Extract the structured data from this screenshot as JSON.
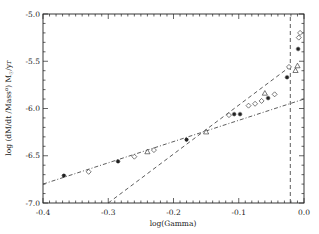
{
  "chart_data": {
    "type": "scatter",
    "title": "",
    "xlabel": "log(Gamma)",
    "ylabel": "log (dM/dt /Mass^α) M☉/yr",
    "ylabel_parts": {
      "prefix": "log (dM/dt /Mass",
      "sup": "α",
      "mid": ") M",
      "sub": "☉",
      "suffix": "/yr"
    },
    "xlim": [
      -0.4,
      0.0
    ],
    "ylim": [
      -7.0,
      -5.0
    ],
    "xticks": [
      -0.4,
      -0.3,
      -0.2,
      -0.1,
      0.0
    ],
    "xtick_labels": [
      "-0.4",
      "-0.3",
      "-0.2",
      "-0.1",
      "0.0"
    ],
    "yticks": [
      -7.0,
      -6.5,
      -6.0,
      -5.5,
      -5.0
    ],
    "ytick_labels": [
      "-7.0",
      "-6.5",
      "-6.0",
      "-5.5",
      "-5.0"
    ],
    "grid": false,
    "legend": null,
    "series": [
      {
        "name": "asterisk",
        "marker": "asterisk",
        "points": [
          [
            -0.368,
            -6.71
          ],
          [
            -0.285,
            -6.56
          ],
          [
            -0.18,
            -6.33
          ],
          [
            -0.107,
            -6.06
          ],
          [
            -0.098,
            -6.06
          ],
          [
            -0.055,
            -5.89
          ],
          [
            -0.026,
            -5.67
          ],
          [
            -0.009,
            -5.37
          ]
        ]
      },
      {
        "name": "diamond",
        "marker": "diamond",
        "points": [
          [
            -0.33,
            -6.67
          ],
          [
            -0.26,
            -6.51
          ],
          [
            -0.23,
            -6.44
          ],
          [
            -0.115,
            -6.07
          ],
          [
            -0.085,
            -5.97
          ],
          [
            -0.075,
            -5.95
          ],
          [
            -0.065,
            -5.92
          ],
          [
            -0.045,
            -5.85
          ],
          [
            -0.023,
            -5.56
          ],
          [
            -0.008,
            -5.25
          ],
          [
            -0.006,
            -5.2
          ]
        ]
      },
      {
        "name": "triangle",
        "marker": "triangle",
        "points": [
          [
            -0.24,
            -6.46
          ],
          [
            -0.15,
            -6.25
          ],
          [
            -0.06,
            -5.84
          ],
          [
            -0.013,
            -5.6
          ],
          [
            -0.01,
            -5.55
          ]
        ]
      }
    ],
    "lines": [
      {
        "name": "dash-dot fit",
        "style": "dashdot",
        "points": [
          [
            -0.4,
            -6.8
          ],
          [
            0.0,
            -5.9
          ]
        ]
      },
      {
        "name": "dashed fit",
        "style": "dashed",
        "points": [
          [
            -0.3,
            -7.0
          ],
          [
            -0.02,
            -5.55
          ]
        ]
      },
      {
        "name": "vertical limit",
        "style": "dashed",
        "points": [
          [
            -0.021,
            -7.0
          ],
          [
            -0.021,
            -5.0
          ]
        ]
      }
    ]
  }
}
